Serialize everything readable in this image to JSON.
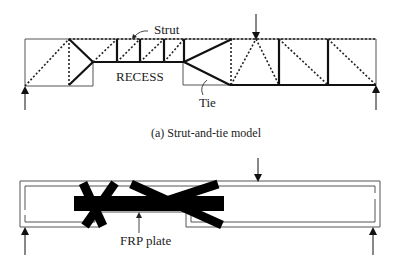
{
  "figure_a": {
    "labels": {
      "strut": "Strut",
      "recess": "RECESS",
      "tie": "Tie"
    },
    "caption": "(a)  Strut-and-tie model"
  },
  "figure_b": {
    "labels": {
      "frp_plate": "FRP plate"
    }
  },
  "colors": {
    "line": "#111111",
    "frame": "#555555",
    "background": "#ffffff"
  }
}
